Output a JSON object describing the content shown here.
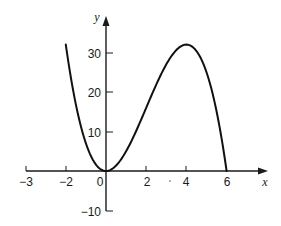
{
  "chart_data": {
    "type": "line",
    "title": "",
    "xlabel": "x",
    "ylabel": "y",
    "function": "y = x^2 (6 - x)",
    "x_range": [
      -2,
      6
    ],
    "xlim": [
      -3,
      7
    ],
    "ylim": [
      -10,
      35
    ],
    "grid": false,
    "legend": null,
    "x_ticks": [
      -3,
      -2,
      0,
      2,
      4,
      6
    ],
    "x_tick_labels": [
      "−3",
      "−2",
      "0",
      "2",
      "4",
      "6"
    ],
    "y_ticks": [
      -10,
      10,
      20,
      30
    ],
    "y_tick_labels": [
      "−10",
      "10",
      "20",
      "30"
    ],
    "series": [
      {
        "name": "curve",
        "x": [
          -2,
          -1.5,
          -1,
          -0.5,
          0,
          0.5,
          1,
          1.5,
          2,
          2.5,
          3,
          3.5,
          4,
          4.5,
          5,
          5.5,
          6
        ],
        "y": [
          32,
          16.88,
          7,
          1.63,
          0,
          1.38,
          5,
          10.13,
          16,
          21.88,
          27,
          30.63,
          32,
          30.38,
          25,
          15.13,
          0
        ]
      }
    ],
    "annotations": [
      "local minimum at (0, 0)",
      "local maximum at (4, 32)"
    ]
  },
  "labels": {
    "x_axis": "x",
    "y_axis": "y",
    "x_ticks": [
      "−3",
      "−2",
      "0",
      "2",
      "4",
      "6"
    ],
    "y_ticks": [
      "30",
      "20",
      "10",
      "−10"
    ]
  }
}
